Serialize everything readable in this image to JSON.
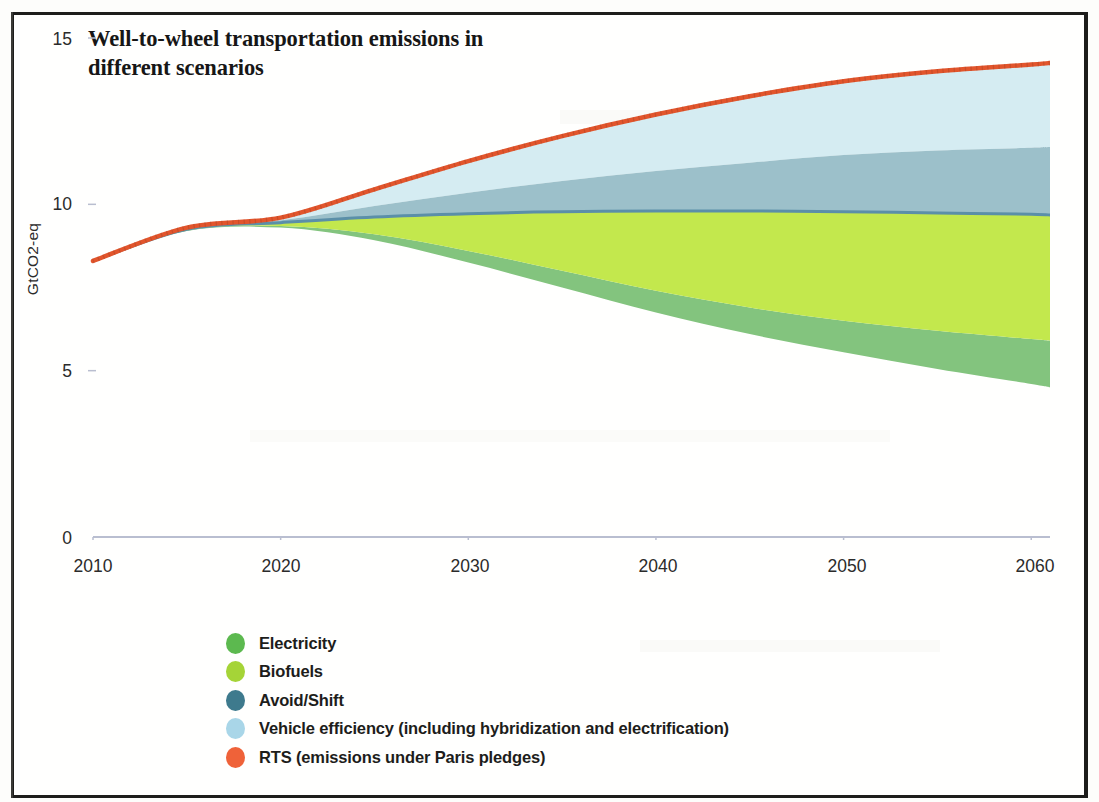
{
  "figure": {
    "title": "Well-to-wheel transportation emissions in different scenarios",
    "title_line1": "Well-to-wheel transportation emissions in",
    "title_line2": "different scenarios"
  },
  "axes": {
    "y_axis_title": "GtCO2-eq",
    "y_ticks": [
      "0",
      "5",
      "10",
      "15"
    ],
    "x_ticks": [
      "2010",
      "2020",
      "2030",
      "2040",
      "2050",
      "2060"
    ]
  },
  "legend": {
    "items": [
      {
        "label": "Electricity",
        "color": "#5cb94f"
      },
      {
        "label": "Biofuels",
        "color": "#a5d437"
      },
      {
        "label": "Avoid/Shift",
        "color": "#3e7a8d"
      },
      {
        "label": "Vehicle efficiency (including hybridization and electrification)",
        "color": "#a9d6e8"
      },
      {
        "label": "RTS (emissions under Paris pledges)",
        "color": "#ef6239"
      }
    ]
  },
  "colors": {
    "rts_line": "#e2552c",
    "vehicle_efficiency_band": "#d5ecf2",
    "avoid_shift_band": "#9cc0ca",
    "avoid_shift_edge": "#5b8fa8",
    "biofuels_band": "#c3e84d",
    "electricity_band": "#83c47e",
    "frame": "#1d1d1b",
    "text": "#2b2b2b",
    "gridline": "#d8dce8",
    "axis": "#b9bed0"
  },
  "chart_data": {
    "type": "area",
    "title": "Well-to-wheel transportation emissions in different scenarios",
    "xlabel": "",
    "ylabel": "GtCO2-eq",
    "xlim": [
      2010,
      2061
    ],
    "ylim": [
      0,
      15
    ],
    "grid": false,
    "legend_position": "below-plot-left",
    "x": [
      2010,
      2015,
      2020,
      2025,
      2030,
      2035,
      2040,
      2045,
      2050,
      2055,
      2060,
      2061
    ],
    "note": "Stacked wedge chart. 'rts' is the top reference line (emissions under Paris pledges). Each band below shows cumulative abatement subtracted from the RTS line; 'net_floor' is the lowest curve remaining after all measures.",
    "series": [
      {
        "name": "RTS (emissions under Paris pledges)",
        "role": "top-line",
        "values": [
          8.3,
          9.3,
          9.6,
          10.45,
          11.3,
          12.05,
          12.7,
          13.25,
          13.7,
          14.0,
          14.2,
          14.25
        ]
      },
      {
        "name": "Vehicle efficiency (including hybridization and electrification)",
        "role": "band",
        "boundary_below": [
          8.3,
          9.28,
          9.52,
          9.95,
          10.35,
          10.7,
          11.0,
          11.25,
          11.48,
          11.62,
          11.7,
          11.72
        ],
        "values": [
          0.0,
          0.02,
          0.08,
          0.5,
          0.95,
          1.35,
          1.7,
          2.0,
          2.22,
          2.38,
          2.5,
          2.53
        ]
      },
      {
        "name": "Avoid/Shift",
        "role": "band",
        "boundary_below": [
          8.3,
          9.25,
          9.45,
          9.62,
          9.72,
          9.78,
          9.8,
          9.8,
          9.78,
          9.74,
          9.7,
          9.68
        ],
        "values": [
          0.0,
          0.03,
          0.07,
          0.33,
          0.63,
          0.92,
          1.2,
          1.45,
          1.7,
          1.88,
          2.0,
          2.04
        ]
      },
      {
        "name": "Biofuels",
        "role": "band",
        "boundary_below": [
          8.3,
          9.22,
          9.35,
          9.1,
          8.6,
          8.0,
          7.4,
          6.9,
          6.5,
          6.2,
          5.95,
          5.9
        ],
        "values": [
          0.0,
          0.03,
          0.1,
          0.52,
          1.12,
          1.78,
          2.4,
          2.9,
          3.28,
          3.54,
          3.75,
          3.78
        ]
      },
      {
        "name": "Electricity",
        "role": "band",
        "boundary_below": [
          8.3,
          9.2,
          9.3,
          8.92,
          8.25,
          7.5,
          6.75,
          6.1,
          5.55,
          5.05,
          4.6,
          4.5
        ],
        "values": [
          0.0,
          0.02,
          0.05,
          0.18,
          0.35,
          0.5,
          0.65,
          0.8,
          0.95,
          1.15,
          1.35,
          1.4
        ]
      }
    ],
    "net_floor": {
      "name": "Net remaining emissions (after all measures)",
      "values": [
        8.3,
        9.2,
        9.3,
        8.92,
        8.25,
        7.5,
        6.75,
        6.1,
        5.55,
        5.05,
        4.6,
        4.5
      ]
    }
  }
}
